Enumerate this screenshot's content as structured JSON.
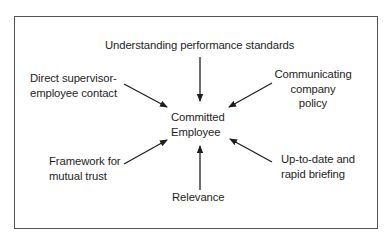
{
  "diagram": {
    "center": {
      "lines": [
        "Committed",
        "Employee"
      ]
    },
    "factors": [
      {
        "id": "top",
        "lines": [
          "Understanding performance standards"
        ]
      },
      {
        "id": "upper-left",
        "lines": [
          "Direct supervisor-",
          "employee contact"
        ]
      },
      {
        "id": "upper-right",
        "lines": [
          "Communicating",
          "company",
          "policy"
        ]
      },
      {
        "id": "lower-left",
        "lines": [
          "Framework for",
          "mutual trust"
        ]
      },
      {
        "id": "lower-right",
        "lines": [
          "Up-to-date and",
          "rapid briefing"
        ]
      },
      {
        "id": "bottom",
        "lines": [
          "Relevance"
        ]
      }
    ],
    "colors": {
      "border": "#555555",
      "arrow": "#1e1e1e",
      "text": "#1e1e1e"
    }
  }
}
